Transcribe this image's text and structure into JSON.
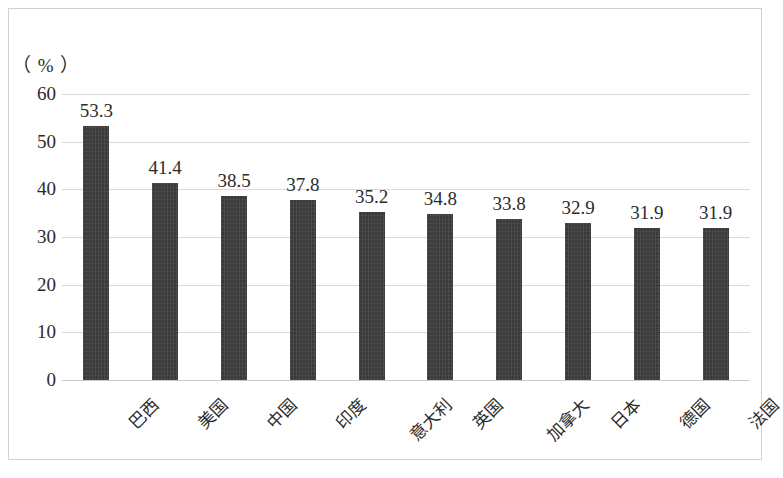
{
  "chart_data": {
    "type": "bar",
    "title": "",
    "subtitle": "",
    "xlabel": "",
    "ylabel": "",
    "unit_label": "（ % ）",
    "categories": [
      "巴西",
      "美国",
      "中国",
      "印度",
      "意大利",
      "英国",
      "加拿大",
      "日本",
      "德国",
      "法国"
    ],
    "values": [
      53.3,
      41.4,
      38.5,
      37.8,
      35.2,
      34.8,
      33.8,
      32.9,
      31.9,
      31.9
    ],
    "value_labels": [
      "53.3",
      "41.4",
      "38.5",
      "37.8",
      "35.2",
      "34.8",
      "33.8",
      "32.9",
      "31.9",
      "31.9"
    ],
    "ylim": [
      0,
      60
    ],
    "y_ticks": [
      0,
      10,
      20,
      30,
      40,
      50,
      60
    ],
    "y_tick_labels": [
      "0",
      "10",
      "20",
      "30",
      "40",
      "50",
      "60"
    ],
    "grid": true,
    "grid_axis": "y",
    "legend": false,
    "legend_position": "none",
    "bar_color": "#3a3a3a",
    "grid_color": "#d9d9d9",
    "frame_color": "#d2d2d2",
    "text_color": "#2b2b2b",
    "category_label_rotation": -45
  }
}
